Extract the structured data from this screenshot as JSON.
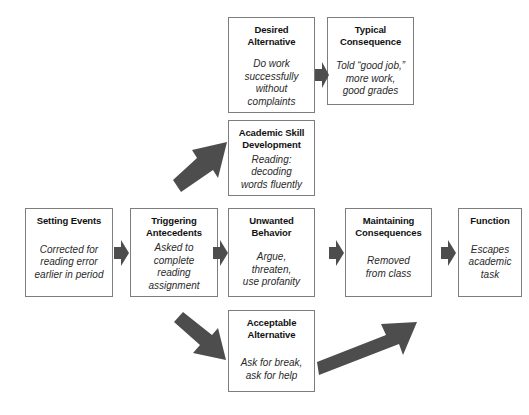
{
  "diagram": {
    "type": "competing-behavior-pathway",
    "boxes": [
      {
        "id": "setting-events",
        "title": "Setting Events",
        "body": "Corrected for\nreading error\nearlier in period"
      },
      {
        "id": "triggering-antecedents",
        "title": "Triggering\nAntecedents",
        "body": "Asked to\ncomplete\nreading\nassignment"
      },
      {
        "id": "unwanted-behavior",
        "title": "Unwanted\nBehavior",
        "body": "Argue,\nthreaten,\nuse profanity"
      },
      {
        "id": "maintaining-consequences",
        "title": "Maintaining\nConsequences",
        "body": "Removed\nfrom class"
      },
      {
        "id": "function",
        "title": "Function",
        "body": "Escapes\nacademic task"
      },
      {
        "id": "desired-alternative",
        "title": "Desired\nAlternative",
        "body": "Do work\nsuccessfully\nwithout\ncomplaints"
      },
      {
        "id": "typical-consequence",
        "title": "Typical\nConsequence",
        "body": "Told “good job,”\nmore work,\ngood grades"
      },
      {
        "id": "academic-skill-development",
        "title": "Academic Skill\nDevelopment",
        "body": "Reading:\ndecoding\nwords fluently"
      },
      {
        "id": "acceptable-alternative",
        "title": "Acceptable\nAlternative",
        "body": "Ask for break,\nask for help"
      }
    ],
    "arrows": [
      {
        "id": "arrow-setting-to-triggering",
        "direction": "right"
      },
      {
        "id": "arrow-triggering-to-unwanted",
        "direction": "right"
      },
      {
        "id": "arrow-unwanted-to-maintaining",
        "direction": "right"
      },
      {
        "id": "arrow-maintaining-to-function",
        "direction": "right"
      },
      {
        "id": "arrow-desired-to-typical",
        "direction": "right"
      },
      {
        "id": "arrow-triggering-to-academic-skill",
        "direction": "up-right"
      },
      {
        "id": "arrow-triggering-to-acceptable",
        "direction": "down-right"
      },
      {
        "id": "arrow-acceptable-to-typical",
        "direction": "up-right-long"
      }
    ],
    "colors": {
      "box_border": "#7d7d7d",
      "arrow_fill": "#4d4d4d",
      "background": "#ffffff",
      "text": "#1b1b1b"
    }
  }
}
